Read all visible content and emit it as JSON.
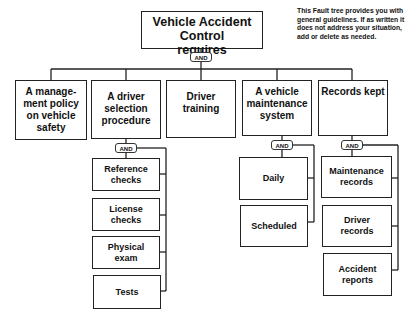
{
  "title": {
    "line1": "Vehicle Accident",
    "line2": "Control",
    "line3": "requires"
  },
  "gate_label": "AND",
  "note": "This Fault tree provides you with general guidelines. If as written it does not address your situation, add or delete as needed.",
  "level1": [
    {
      "id": "policy",
      "text": "A manage-ment policy on vehicle safety"
    },
    {
      "id": "selection",
      "text": "A driver selection procedure"
    },
    {
      "id": "training",
      "text": "Driver training"
    },
    {
      "id": "maintenance",
      "text": "A vehicle maintenance system"
    },
    {
      "id": "records",
      "text": "Records kept"
    }
  ],
  "selection_children": [
    "Reference checks",
    "License checks",
    "Physical exam",
    "Tests"
  ],
  "maintenance_children": [
    "Daily",
    "Scheduled"
  ],
  "records_children": [
    "Maintenance records",
    "Driver records",
    "Accident reports"
  ]
}
